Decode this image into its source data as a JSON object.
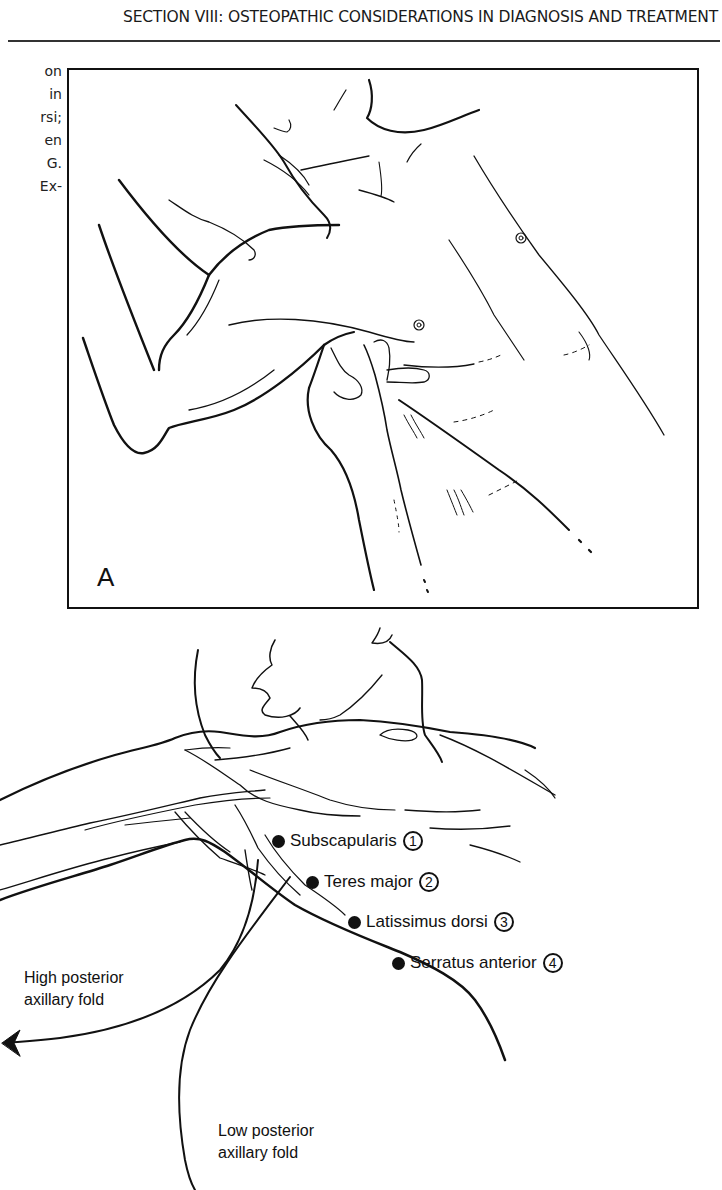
{
  "header": {
    "title": "SECTION VIII: OSTEOPATHIC CONSIDERATIONS IN DIAGNOSIS AND TREATMENT"
  },
  "side_text": {
    "lines": [
      "on",
      "in",
      "rsi;",
      "en",
      "G.",
      "Ex-"
    ]
  },
  "figure_a": {
    "panel_label": "A"
  },
  "figure_b": {
    "muscles": [
      {
        "name": "Subscapularis",
        "number": "1"
      },
      {
        "name": "Teres major",
        "number": "2"
      },
      {
        "name": "Latissimus dorsi",
        "number": "3"
      },
      {
        "name": "Serratus anterior",
        "number": "4"
      }
    ],
    "high_fold": {
      "line1": "High posterior",
      "line2": "axillary fold"
    },
    "low_fold": {
      "line1": "Low posterior",
      "line2": "axillary fold"
    }
  }
}
